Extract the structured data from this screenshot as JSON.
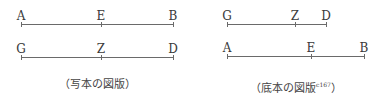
{
  "left_figure": {
    "caption": "（写本の図版）",
    "lines": [
      {
        "points": [
          {
            "label": "A",
            "x": 21
          },
          {
            "label": "E",
            "x": 101
          },
          {
            "label": "B",
            "x": 173
          }
        ],
        "y": 24
      },
      {
        "points": [
          {
            "label": "G",
            "x": 21
          },
          {
            "label": "Z",
            "x": 101
          },
          {
            "label": "D",
            "x": 173
          }
        ],
        "y": 57
      }
    ]
  },
  "right_figure": {
    "caption": "（底本の図版",
    "caption_ref": "c167",
    "caption_close": "）",
    "lines": [
      {
        "points": [
          {
            "label": "G",
            "x": 227
          },
          {
            "label": "Z",
            "x": 295
          },
          {
            "label": "D",
            "x": 326
          }
        ],
        "y": 24
      },
      {
        "points": [
          {
            "label": "A",
            "x": 227
          },
          {
            "label": "E",
            "x": 311
          },
          {
            "label": "B",
            "x": 364
          }
        ],
        "y": 56
      }
    ]
  }
}
